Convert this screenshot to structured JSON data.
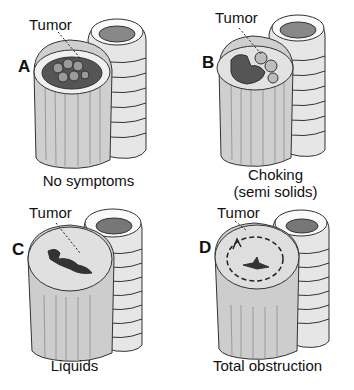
{
  "figure": {
    "panels": [
      {
        "id": "A",
        "letter": "A",
        "pointer_label": "Tumor",
        "caption_lines": [
          "No symptoms"
        ],
        "lumen": "open-with-nodular-tumor"
      },
      {
        "id": "B",
        "letter": "B",
        "pointer_label": "Tumor",
        "caption_lines": [
          "Choking",
          "(semi solids)"
        ],
        "lumen": "partially-narrowed"
      },
      {
        "id": "C",
        "letter": "C",
        "pointer_label": "Tumor",
        "caption_lines": [
          "Liquids"
        ],
        "lumen": "narrow-slit"
      },
      {
        "id": "D",
        "letter": "D",
        "pointer_label": "Tumor",
        "caption_lines": [
          "Total obstruction"
        ],
        "lumen": "closed-with-circumferential-arrow"
      }
    ]
  }
}
